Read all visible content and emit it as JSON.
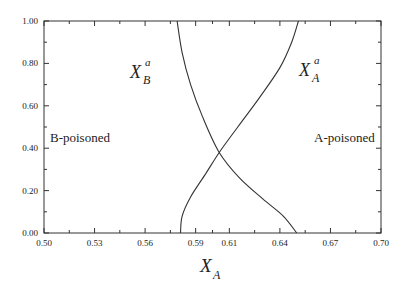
{
  "chart_data": {
    "type": "line",
    "title": "",
    "xlabel": "X_A",
    "ylabel": "",
    "xlim": [
      0.5,
      0.7
    ],
    "ylim": [
      0.0,
      1.0
    ],
    "grid": false,
    "x_ticks": [
      "0.50",
      "0.53",
      "0.56",
      "0.59",
      "0.61",
      "0.64",
      "0.67",
      "0.70"
    ],
    "y_ticks": [
      "0.00",
      "0.20",
      "0.40",
      "0.60",
      "0.80",
      "1.00"
    ],
    "series": [
      {
        "name": "X_B^a",
        "points": [
          [
            0.579,
            1.0
          ],
          [
            0.582,
            0.85
          ],
          [
            0.587,
            0.7
          ],
          [
            0.594,
            0.55
          ],
          [
            0.604,
            0.38
          ],
          [
            0.616,
            0.26
          ],
          [
            0.63,
            0.16
          ],
          [
            0.642,
            0.08
          ],
          [
            0.65,
            0.0
          ]
        ]
      },
      {
        "name": "X_A^a",
        "points": [
          [
            0.581,
            0.0
          ],
          [
            0.582,
            0.08
          ],
          [
            0.587,
            0.17
          ],
          [
            0.596,
            0.28
          ],
          [
            0.604,
            0.38
          ],
          [
            0.615,
            0.5
          ],
          [
            0.628,
            0.64
          ],
          [
            0.64,
            0.78
          ],
          [
            0.647,
            0.9
          ],
          [
            0.651,
            1.0
          ]
        ]
      }
    ],
    "annotations": [
      {
        "text": "B-poisoned",
        "x": 0.51,
        "y": 0.43
      },
      {
        "text": "A-poisoned",
        "x": 0.667,
        "y": 0.43
      },
      {
        "text": "X_B^a",
        "x": 0.555,
        "y": 0.77
      },
      {
        "text": "X_A^a",
        "x": 0.656,
        "y": 0.8
      }
    ]
  },
  "labels": {
    "xlabel_main": "X",
    "xlabel_sub": "A",
    "b_poisoned": "B-poisoned",
    "a_poisoned": "A-poisoned",
    "xb_main": "X",
    "xb_sup": "a",
    "xb_sub": "B",
    "xa_main": "X",
    "xa_sup": "a",
    "xa_sub": "A"
  }
}
